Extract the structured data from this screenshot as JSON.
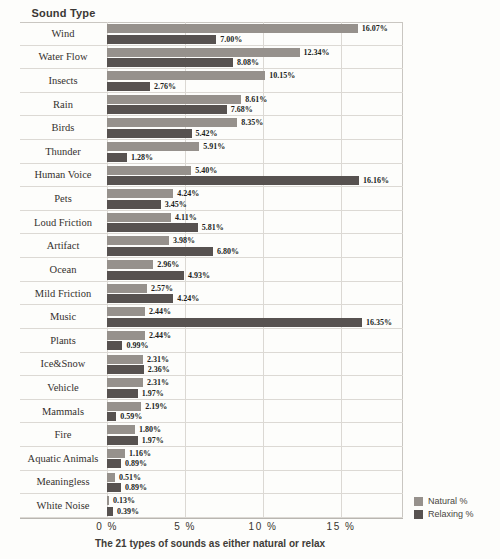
{
  "header": {
    "axis_title": "Sound Type"
  },
  "caption": "The 21 types of sounds as either natural or relax",
  "chart_data": {
    "type": "bar",
    "orientation": "horizontal",
    "title": "The 21 types of sounds as either natural or relax",
    "ylabel": "Sound Type",
    "xlabel": "",
    "xlim": [
      0,
      18.9
    ],
    "grid": "vertical-gridlines-on",
    "legend_position": "bottom-right",
    "x_ticks": [
      {
        "label": "0 %",
        "value": 0
      },
      {
        "label": "5 %",
        "value": 5
      },
      {
        "label": "10 %",
        "value": 10
      },
      {
        "label": "15 %",
        "value": 15
      }
    ],
    "categories": [
      "Wind",
      "Water Flow",
      "Insects",
      "Rain",
      "Birds",
      "Thunder",
      "Human Voice",
      "Pets",
      "Loud Friction",
      "Artifact",
      "Ocean",
      "Mild Friction",
      "Music",
      "Plants",
      "Ice&Snow",
      "Vehicle",
      "Mammals",
      "Fire",
      "Aquatic Animals",
      "Meaningless",
      "White Noise"
    ],
    "series": [
      {
        "name": "Natural %",
        "color": "#96918c",
        "values": [
          16.07,
          12.34,
          10.15,
          8.61,
          8.35,
          5.91,
          5.4,
          4.24,
          4.11,
          3.98,
          2.96,
          2.57,
          2.44,
          2.44,
          2.31,
          2.31,
          2.19,
          1.8,
          1.16,
          0.51,
          0.13
        ]
      },
      {
        "name": "Relaxing %",
        "color": "#575250",
        "values": [
          7.0,
          8.08,
          2.76,
          7.68,
          5.42,
          1.28,
          16.16,
          3.45,
          5.81,
          6.8,
          4.93,
          4.24,
          16.35,
          0.99,
          2.36,
          1.97,
          0.59,
          1.97,
          0.89,
          0.89,
          0.39
        ]
      }
    ],
    "value_label_format": "0.00%"
  }
}
